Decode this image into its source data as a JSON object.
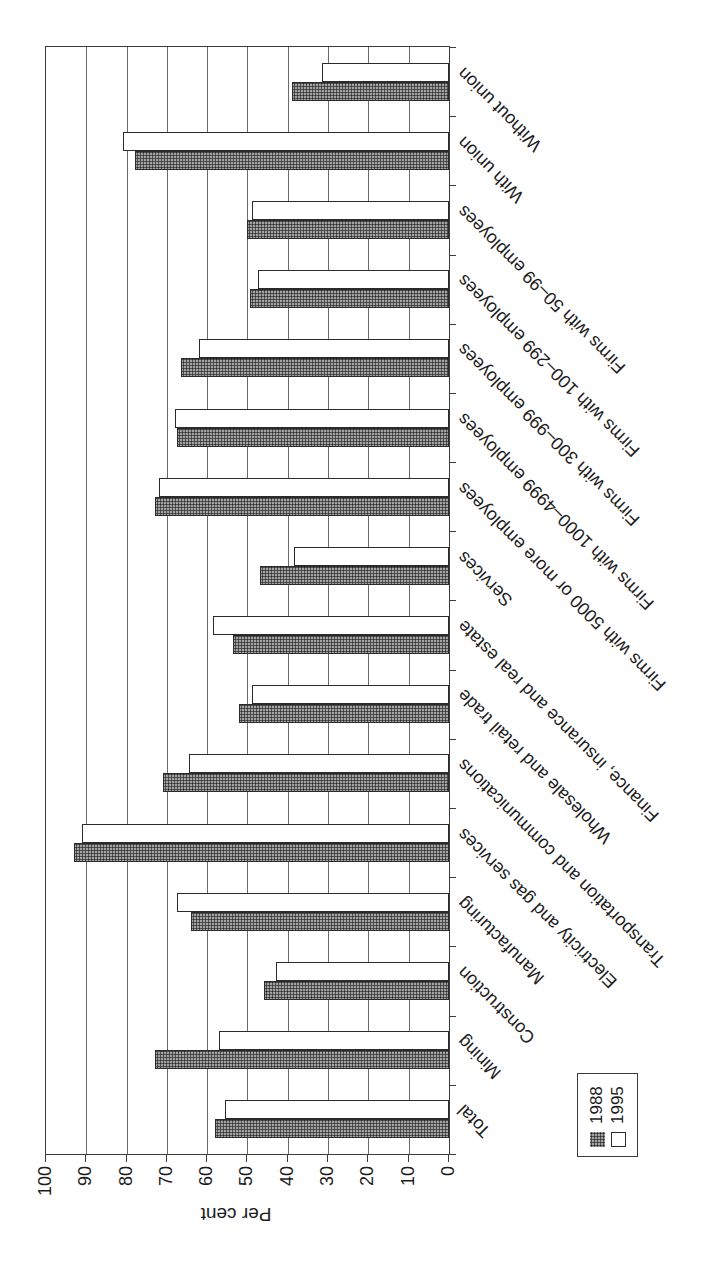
{
  "chart_data": {
    "type": "bar",
    "title": "",
    "ylabel": "Per cent",
    "ylim": [
      0,
      100
    ],
    "yticks": [
      0,
      10,
      20,
      30,
      40,
      50,
      60,
      70,
      80,
      90,
      100
    ],
    "grid": true,
    "legend_position": "bottom-left",
    "page_rotation": "chart printed rotated 90 degrees on portrait page",
    "categories": [
      "Total",
      "Mining",
      "Construction",
      "Manufacturing",
      "Electricity and gas services",
      "Transportation and communications",
      "Wholesale and retail trade",
      "Finance, insurance and real estate",
      "Services",
      "Firms with 5000 or more employees",
      "Firms with 1000–4999 employees",
      "Firms with 300–999 employees",
      "Firms with 100–299 employees",
      "Firms with 50–99 employees",
      "With union",
      "Without union"
    ],
    "series": [
      {
        "name": "1988",
        "values": [
          58,
          73,
          46,
          64,
          93,
          71,
          52,
          53.5,
          47,
          73,
          67.5,
          66.5,
          49.5,
          50,
          78,
          39
        ]
      },
      {
        "name": "1995",
        "values": [
          55.5,
          57,
          43,
          67.5,
          91,
          64.5,
          49,
          58.5,
          38.5,
          72,
          68,
          62,
          47.5,
          49,
          81,
          31.5
        ]
      }
    ]
  },
  "colors": {
    "bar_1988_fill": "#a2a2a2",
    "bar_1988_dot": "#2e2e2e",
    "bar_1995_fill": "#ffffff",
    "bar_border": "#2b2b2b",
    "axis_line": "#3c3c3c",
    "gridline": "#6a6a6a",
    "text": "#1c1c1c"
  }
}
